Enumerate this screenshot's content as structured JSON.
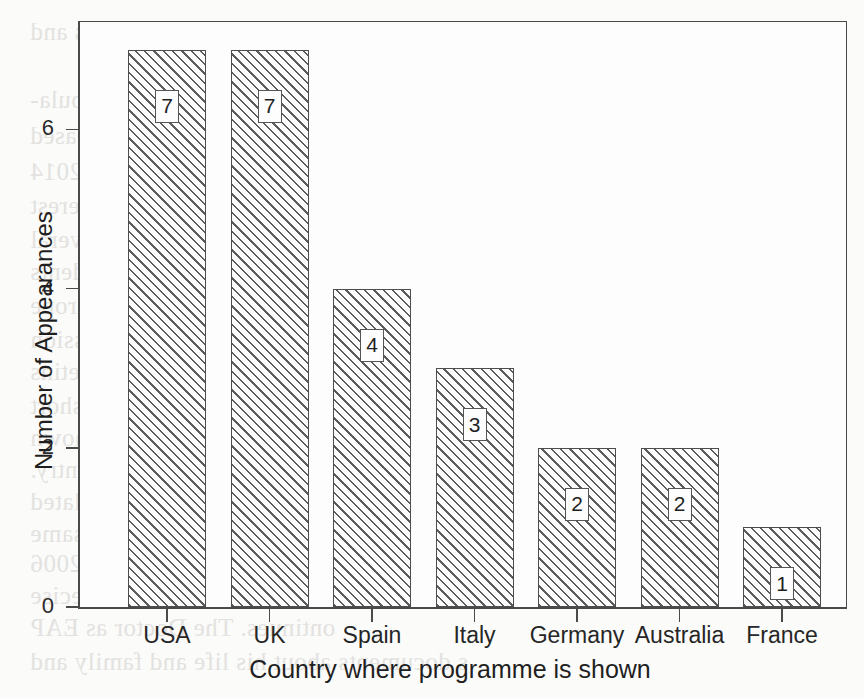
{
  "chart_data": {
    "type": "bar",
    "title": "",
    "xlabel": "Country where programme is shown",
    "ylabel": "Number of Appearances",
    "categories": [
      "USA",
      "UK",
      "Spain",
      "Italy",
      "Germany",
      "Australia",
      "France"
    ],
    "values": [
      7,
      7,
      4,
      3,
      2,
      2,
      1
    ],
    "value_labels": [
      "7",
      "7",
      "4",
      "3",
      "2",
      "2",
      "1"
    ],
    "ylim": [
      0,
      7.6
    ],
    "yticks": [
      0,
      2,
      4,
      6
    ],
    "ytick_labels": [
      "0",
      "2",
      "4",
      "6"
    ],
    "grid": false,
    "legend": false,
    "bar_style": "diagonal-hatch",
    "frame": "box",
    "colors": {
      "axis": "#4a4a4a",
      "bar_edge": "#4d4d4d",
      "hatch": "#464646",
      "text": "#1f1f1f",
      "background": "#fbfbfa"
    }
  },
  "ghost_text": {
    "lines": [
      "wed in Hvar, by Flowers.  ces and",
      "nts.",
      "shows the comparative popula-",
      "ter the programme was released",
      "1995 to 2005, rising to 2014",
      "ure smartphone and tablet interest",
      "e leading politicians and several",
      "alk shows. Several respondents",
      "erviewed by reporters across Europe",
      "he 2008 record.  The latest discussion",
      "ademic papers and broadcast bulletins",
      "further technical detail.  As a short",
      "d in the sample, the figures shown",
      "ber of appearances in each country.",
      "ted to the season finale and related",
      "national coverage over the same",
      "ed in the archive material.  In 2006",
      "ons are not to be taken as precise",
      "ontinues.  The Doctor as EAP",
      "s documents about his life and family and"
    ],
    "positions": [
      [
        30,
        18
      ],
      [
        430,
        48
      ],
      [
        30,
        86
      ],
      [
        30,
        122
      ],
      [
        30,
        158
      ],
      [
        30,
        192
      ],
      [
        30,
        226
      ],
      [
        30,
        258
      ],
      [
        30,
        292
      ],
      [
        30,
        326
      ],
      [
        30,
        358
      ],
      [
        30,
        392
      ],
      [
        30,
        424
      ],
      [
        30,
        456
      ],
      [
        30,
        488
      ],
      [
        30,
        520
      ],
      [
        30,
        550
      ],
      [
        30,
        582
      ],
      [
        30,
        614
      ],
      [
        30,
        648
      ]
    ]
  }
}
